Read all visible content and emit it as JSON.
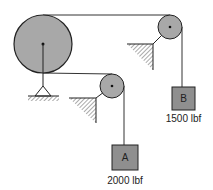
{
  "diagram": {
    "type": "pulley-system",
    "pulleys": [
      {
        "id": "large",
        "cx": 43,
        "cy": 44,
        "r": 29,
        "support": "pin-ground"
      },
      {
        "id": "pulley-a",
        "cx": 112,
        "cy": 86,
        "r": 12,
        "support": "wall-bracket"
      },
      {
        "id": "pulley-b",
        "cx": 170,
        "cy": 27,
        "r": 12,
        "support": "wall-bracket"
      }
    ],
    "weights": [
      {
        "id": "A",
        "label": "A",
        "load": "2000 lbf"
      },
      {
        "id": "B",
        "label": "B",
        "load": "1500 lbf"
      }
    ],
    "colors": {
      "pulley_fill": "#a8a8a8",
      "box_fill": "#8f8f8f",
      "line": "#333333"
    }
  }
}
